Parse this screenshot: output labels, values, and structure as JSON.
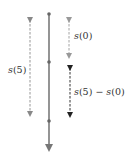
{
  "diagram": {
    "main_line": {
      "x": 49,
      "y_top": 14,
      "y_bottom": 151,
      "points_y": [
        14,
        62,
        121
      ],
      "color": "#777777"
    },
    "arrows": [
      {
        "id": "s5",
        "x": 30,
        "y1": 16,
        "y2": 118,
        "style": "dashed",
        "color": "#888888"
      },
      {
        "id": "s0",
        "x": 69,
        "y1": 16,
        "y2": 60,
        "style": "dashed",
        "color": "#999999"
      },
      {
        "id": "diff",
        "x": 70,
        "y1": 64,
        "y2": 119,
        "style": "dashed",
        "color": "#333333"
      }
    ],
    "labels": {
      "s5": {
        "fn": "s",
        "arg": "(5)"
      },
      "s0": {
        "fn": "s",
        "arg": "(0)"
      },
      "diff": {
        "fn1": "s",
        "arg1": "(5)",
        "op": " − ",
        "fn2": "s",
        "arg2": "(0)"
      }
    }
  }
}
